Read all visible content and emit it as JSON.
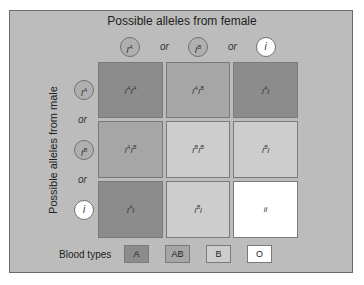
{
  "title": "Possible alleles from female",
  "ylabel": "Possible alleles from male",
  "female_alleles": [
    {
      "base": "I",
      "sup": "A",
      "fill": "#b0b0b0"
    },
    {
      "base": "I",
      "sup": "B",
      "fill": "#b0b0b0"
    },
    {
      "base": "i",
      "sup": "",
      "fill": "#ffffff"
    }
  ],
  "male_alleles": [
    {
      "base": "I",
      "sup": "A",
      "fill": "#b0b0b0"
    },
    {
      "base": "I",
      "sup": "B",
      "fill": "#b0b0b0"
    },
    {
      "base": "i",
      "sup": "",
      "fill": "#ffffff"
    }
  ],
  "or_label": "or",
  "grid": [
    [
      {
        "parts": [
          "I",
          "A",
          "I",
          "A"
        ],
        "type": "A"
      },
      {
        "parts": [
          "I",
          "A",
          "I",
          "B"
        ],
        "type": "AB"
      },
      {
        "parts": [
          "I",
          "A",
          "i",
          ""
        ],
        "type": "A"
      }
    ],
    [
      {
        "parts": [
          "I",
          "A",
          "I",
          "B"
        ],
        "type": "AB"
      },
      {
        "parts": [
          "I",
          "B",
          "I",
          "B"
        ],
        "type": "B"
      },
      {
        "parts": [
          "I",
          "B",
          "i",
          ""
        ],
        "type": "B"
      }
    ],
    [
      {
        "parts": [
          "I",
          "A",
          "i",
          ""
        ],
        "type": "A"
      },
      {
        "parts": [
          "I",
          "B",
          "i",
          ""
        ],
        "type": "B"
      },
      {
        "parts": [
          "i",
          "",
          "i",
          ""
        ],
        "type": "O"
      }
    ]
  ],
  "legend": {
    "label": "Blood types",
    "items": [
      {
        "label": "A",
        "color": "#8c8c8c"
      },
      {
        "label": "AB",
        "color": "#a6a6a6"
      },
      {
        "label": "B",
        "color": "#cdcdcd"
      },
      {
        "label": "O",
        "color": "#ffffff"
      }
    ]
  },
  "colors": {
    "A": "#8c8c8c",
    "AB": "#a6a6a6",
    "B": "#cdcdcd",
    "O": "#ffffff",
    "panel": "#bcbcbc"
  }
}
